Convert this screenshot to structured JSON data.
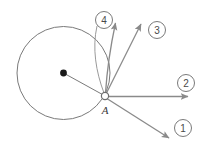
{
  "figure": {
    "background_color": "#ffffff",
    "stroke_color": "#6e6e6e",
    "dark_stroke_color": "#4a4a4a",
    "dot_color": "#1a1a1a",
    "width": 204,
    "height": 146
  },
  "circle": {
    "name": "main-circle",
    "cx": 63.5,
    "cy": 73,
    "r": 46.5,
    "stroke": "#6e6e6e",
    "stroke_width": 1
  },
  "center_dot": {
    "name": "circle-center-dot",
    "cx": 63.5,
    "cy": 73,
    "r": 3.4,
    "fill": "#1a1a1a"
  },
  "radius_line": {
    "name": "radius-segment",
    "x1": 63.5,
    "y1": 73,
    "x2": 104,
    "y2": 95.5
  },
  "point_a": {
    "name": "point-a",
    "label": "A",
    "cx": 105,
    "cy": 96,
    "r": 3.6,
    "fill": "#ffffff",
    "stroke": "#6e6e6e",
    "label_x": 105,
    "label_y": 110
  },
  "vectors": [
    {
      "id": "1",
      "name": "vector-1",
      "kind": "straight",
      "x1": 105,
      "y1": 96,
      "x2": 171,
      "y2": 139,
      "label_cx": 183,
      "label_cy": 128,
      "label_r": 8.5,
      "description": "down-right diagonal arrow"
    },
    {
      "id": "2",
      "name": "vector-2",
      "kind": "straight",
      "x1": 105,
      "y1": 96,
      "x2": 190,
      "y2": 96,
      "label_cx": 186,
      "label_cy": 83,
      "label_r": 8.5,
      "description": "horizontal right arrow"
    },
    {
      "id": "3",
      "name": "vector-3",
      "kind": "straight",
      "x1": 105,
      "y1": 96,
      "x2": 142,
      "y2": 21,
      "label_cx": 157,
      "label_cy": 30,
      "label_r": 8.5,
      "description": "up-right diagonal arrow"
    },
    {
      "id": "4",
      "name": "vector-4",
      "kind": "curved",
      "x1": 105,
      "y1": 96,
      "cx": 108,
      "cy": 48,
      "x2": 116,
      "y2": 19,
      "label_cx": 104,
      "label_cy": 20,
      "label_r": 8.5,
      "description": "curved arrow bending upward"
    }
  ]
}
